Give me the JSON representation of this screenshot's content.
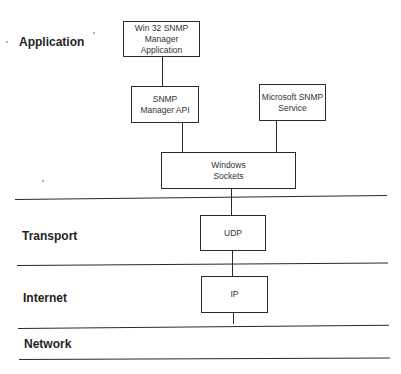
{
  "layers": [
    {
      "label": "Application"
    },
    {
      "label": "Transport"
    },
    {
      "label": "Internet"
    },
    {
      "label": "Network"
    }
  ],
  "boxes": {
    "win32_manager_app": {
      "line1": "Win 32 SNMP",
      "line2": "Manager Application"
    },
    "snmp_manager_api": {
      "line1": "SNMP",
      "line2": "Manager API"
    },
    "microsoft_snmp_service": {
      "line1": "Microsoft SNMP",
      "line2": "Service"
    },
    "windows_sockets": {
      "line1": "Windows",
      "line2": "Sockets"
    },
    "udp": {
      "line1": "UDP"
    },
    "ip": {
      "line1": "IP"
    }
  },
  "colors": {
    "line": "#2a2a2a",
    "background": "#ffffff",
    "text": "#1f1f1f"
  }
}
